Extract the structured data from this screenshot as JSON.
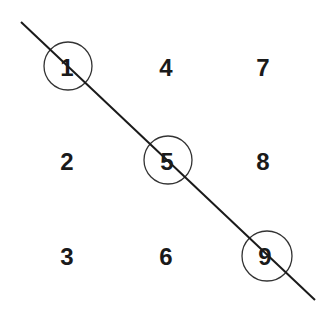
{
  "diagram": {
    "type": "grid-diagonal",
    "columns": [
      [
        "1",
        "2",
        "3"
      ],
      [
        "4",
        "5",
        "6"
      ],
      [
        "7",
        "8",
        "9"
      ]
    ],
    "cells": [
      {
        "label": "1",
        "x": 67,
        "y": 67,
        "circled": true
      },
      {
        "label": "4",
        "x": 166,
        "y": 67,
        "circled": false
      },
      {
        "label": "7",
        "x": 263,
        "y": 67,
        "circled": false
      },
      {
        "label": "2",
        "x": 67,
        "y": 161,
        "circled": false
      },
      {
        "label": "5",
        "x": 167,
        "y": 161,
        "circled": true
      },
      {
        "label": "8",
        "x": 263,
        "y": 161,
        "circled": false
      },
      {
        "label": "3",
        "x": 67,
        "y": 256,
        "circled": false
      },
      {
        "label": "6",
        "x": 166,
        "y": 256,
        "circled": false
      },
      {
        "label": "9",
        "x": 265,
        "y": 256,
        "circled": true
      }
    ],
    "diagonal_line": {
      "x1": 21,
      "y1": 22,
      "x2": 315,
      "y2": 300
    },
    "circle_radius": 24,
    "colors": {
      "line": "#1a1a1a",
      "circle": "#333333",
      "text": "#1a1a1a",
      "background": "#ffffff"
    }
  }
}
